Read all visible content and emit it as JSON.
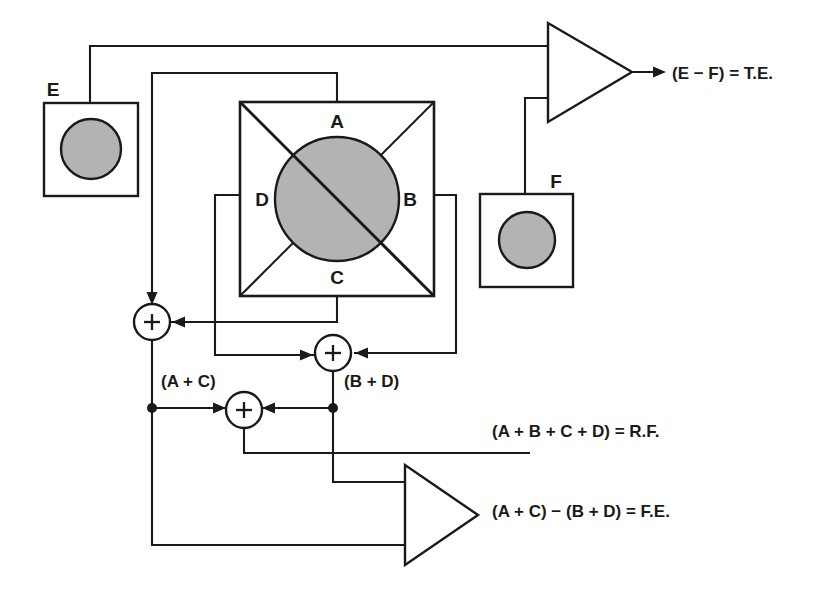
{
  "diagram": {
    "colors": {
      "line": "#1a1a1a",
      "sensor_fill": "#b3b3b3",
      "background": "#ffffff"
    },
    "detector": {
      "name": "quadrant-detector",
      "quadrants": [
        {
          "id": "A",
          "label": "A",
          "position": "top"
        },
        {
          "id": "B",
          "label": "B",
          "position": "right"
        },
        {
          "id": "C",
          "label": "C",
          "position": "bottom"
        },
        {
          "id": "D",
          "label": "D",
          "position": "left"
        }
      ]
    },
    "sensors": [
      {
        "id": "E",
        "label": "E",
        "name": "photodiode-e"
      },
      {
        "id": "F",
        "label": "F",
        "name": "photodiode-f"
      }
    ],
    "summers": [
      {
        "id": "sum-ac",
        "symbol": "+",
        "output_label": "(A + C)"
      },
      {
        "id": "sum-bd",
        "symbol": "+",
        "output_label": "(B + D)"
      },
      {
        "id": "sum-rf",
        "symbol": "+",
        "output_label": ""
      }
    ],
    "intermediate_labels": {
      "ac": "(A + C)",
      "bd": "(B + D)"
    },
    "amplifiers": [
      {
        "id": "amp-te",
        "name": "differential-amp-te",
        "output": "(E − F) = T.E."
      },
      {
        "id": "amp-fe",
        "name": "differential-amp-fe",
        "output": "(A + C) − (B + D) = F.E."
      }
    ],
    "outputs": [
      {
        "id": "te",
        "label": "(E − F) = T.E."
      },
      {
        "id": "rf",
        "label": "(A + B + C + D) = R.F."
      },
      {
        "id": "fe",
        "label": "(A + C) − (B + D) = F.E."
      }
    ]
  }
}
